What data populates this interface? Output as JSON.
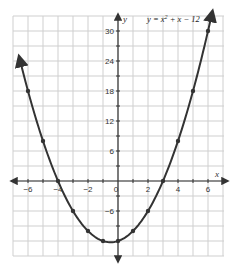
{
  "chart_data": {
    "type": "line",
    "title_parts": {
      "lhs": "y = x",
      "exp": "2",
      "rhs": " + x − 12"
    },
    "xlabel": "x",
    "ylabel": "y",
    "xlim": [
      -7,
      7
    ],
    "ylim": [
      -15,
      33
    ],
    "grid": true,
    "legend": "none",
    "x_ticks": [
      -6,
      -4,
      -2,
      0,
      2,
      4,
      6
    ],
    "x_tick_labels": [
      "−6",
      "−4",
      "−2",
      "0",
      "2",
      "4",
      "6"
    ],
    "y_ticks": [
      30,
      24,
      18,
      12,
      6,
      -6
    ],
    "y_tick_labels": [
      "30",
      "24",
      "18",
      "12",
      "6",
      "−6"
    ],
    "series": [
      {
        "name": "y = x² + x − 12",
        "color": "#333333",
        "x": [
          -6,
          -5,
          -4,
          -3,
          -2,
          -1,
          0,
          1,
          2,
          3,
          4,
          5,
          6
        ],
        "values": [
          18,
          8,
          0,
          -6,
          -10,
          -12,
          -12,
          -10,
          -6,
          0,
          8,
          18,
          30
        ]
      }
    ],
    "curve_extends": {
      "left_end": [
        -6.6,
        24.96
      ],
      "right_end": [
        6.3,
        34
      ]
    }
  },
  "colors": {
    "grid": "#cfcfcf",
    "axis": "#333333",
    "curve": "#333333",
    "background": "#ffffff"
  }
}
